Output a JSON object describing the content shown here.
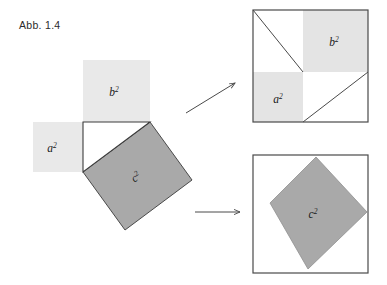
{
  "figure": {
    "caption": "Abb. 1.4",
    "colors": {
      "light_shade": "#e8e8e8",
      "dark_shade": "#a8a8a8",
      "outline": "#4a4a4a",
      "background": "#ffffff",
      "label_text": "#1a1a1a"
    },
    "labels": {
      "a_base": "a",
      "b_base": "b",
      "c_base": "c",
      "exponent": "2",
      "a_squared": "a²",
      "b_squared": "b²",
      "c_squared": "c²"
    },
    "panels": [
      {
        "name": "left-construction",
        "description": "Right triangle with squares on each of its three sides",
        "shapes": [
          {
            "id": "square-a",
            "label": "a²",
            "fill": "light_shade",
            "x": 33,
            "y": 122,
            "w": 50,
            "h": 50
          },
          {
            "id": "square-b",
            "label": "b²",
            "fill": "light_shade",
            "x": 83,
            "y": 60,
            "w": 67,
            "h": 62
          },
          {
            "id": "triangle",
            "label": "",
            "fill": "background",
            "points": "83,122 150,122 83,172"
          },
          {
            "id": "square-c",
            "label": "c²",
            "fill": "dark_shade",
            "points": "83,172 150,122 192,180 125,230"
          }
        ]
      },
      {
        "name": "top-right-dissection",
        "description": "Square of side a+b containing shaded a² and b² plus four right triangles",
        "outer": {
          "x": 253,
          "y": 10,
          "w": 115,
          "h": 112
        },
        "split_x": 303,
        "split_y": 72,
        "shaded": [
          {
            "id": "b-square-region",
            "label": "b²",
            "fill": "light_shade",
            "x": 303,
            "y": 10,
            "w": 65,
            "h": 62
          },
          {
            "id": "a-square-region",
            "label": "a²",
            "fill": "light_shade",
            "x": 253,
            "y": 72,
            "w": 50,
            "h": 50
          }
        ],
        "cut_lines": [
          {
            "from": [
              253,
              10
            ],
            "to": [
              303,
              72
            ]
          },
          {
            "from": [
              303,
              122
            ],
            "to": [
              368,
              72
            ]
          }
        ]
      },
      {
        "name": "bottom-right-dissection",
        "description": "Square of side a+b containing the tilted c² square and four right triangles",
        "outer": {
          "x": 253,
          "y": 155,
          "w": 115,
          "h": 118
        },
        "inner": {
          "id": "c-square-region",
          "label": "c²",
          "fill": "dark_shade",
          "points": "270,203 316,158 358,212 307,268"
        }
      }
    ],
    "arrows": [
      {
        "name": "arrow-to-top-panel",
        "from": [
          186,
          113
        ],
        "to": [
          236,
          82
        ],
        "style": "diagonal-up-right"
      },
      {
        "name": "arrow-to-bottom-panel",
        "from": [
          195,
          212
        ],
        "to": [
          241,
          212
        ],
        "style": "horizontal-right"
      }
    ]
  }
}
